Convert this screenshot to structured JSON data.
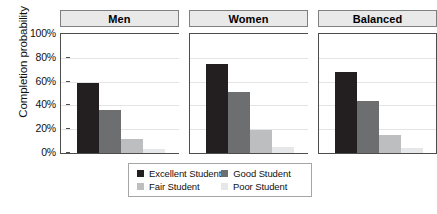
{
  "chart_data": {
    "type": "bar",
    "title": "",
    "xlabel": "",
    "ylabel": "Completion probability",
    "ylim": [
      0,
      100
    ],
    "ytick_labels": [
      "100%",
      "80%",
      "60%",
      "40%",
      "20%",
      "0%"
    ],
    "ytick_values": [
      100,
      80,
      60,
      40,
      20,
      0
    ],
    "grid": true,
    "legend_position": "bottom",
    "panels": [
      "Men",
      "Women",
      "Balanced"
    ],
    "categories": [
      "Men",
      "Women",
      "Balanced"
    ],
    "series": [
      {
        "name": "Excellent Student",
        "color": "#231f20",
        "values": [
          59,
          75,
          68
        ]
      },
      {
        "name": "Good Student",
        "color": "#6d6e70",
        "values": [
          36,
          51,
          44
        ]
      },
      {
        "name": "Fair Student",
        "color": "#bcbec0",
        "values": [
          12,
          19,
          15
        ]
      },
      {
        "name": "Poor Student",
        "color": "#e6e7e8",
        "values": [
          3,
          5,
          4
        ]
      }
    ]
  },
  "axis": {
    "ylabel": "Completion probability",
    "ticks": [
      "100%",
      "80%",
      "60%",
      "40%",
      "20%",
      "0%"
    ]
  },
  "panels": [
    {
      "label": "Men"
    },
    {
      "label": "Women"
    },
    {
      "label": "Balanced"
    }
  ],
  "legend": {
    "items": [
      {
        "label": "Excellent Student",
        "color": "#231f20"
      },
      {
        "label": "Good Student",
        "color": "#6d6e70"
      },
      {
        "label": "Fair Student",
        "color": "#bcbec0"
      },
      {
        "label": "Poor Student",
        "color": "#e6e7e8"
      }
    ]
  }
}
